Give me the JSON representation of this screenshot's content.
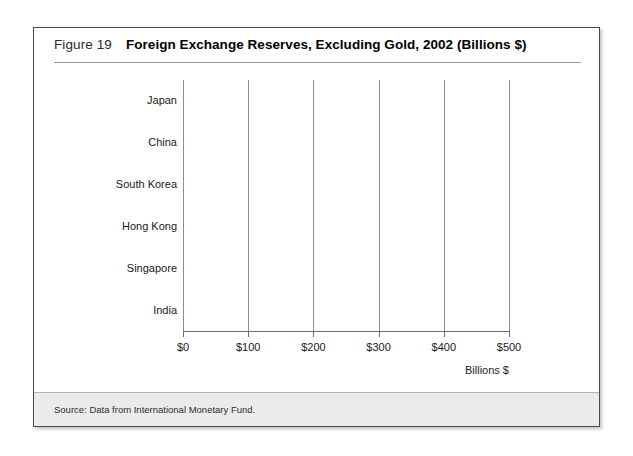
{
  "figure": {
    "number_label": "Figure 19",
    "title": "Foreign Exchange Reserves, Excluding Gold, 2002 (Billions $)",
    "source_note": "Source: Data from International Monetary Fund."
  },
  "colors": {
    "bar_fill": "#3a3a3a",
    "gridline": "#8d8d8d",
    "frame_border": "#4a4a4a",
    "footer_band": "#ebebeb"
  },
  "chart_data": {
    "type": "bar",
    "orientation": "horizontal",
    "title": "Foreign Exchange Reserves, Excluding Gold, 2002 (Billions $)",
    "categories": [
      "Japan",
      "China",
      "South Korea",
      "Hong Kong",
      "Singapore",
      "India"
    ],
    "values": [
      445,
      287,
      122,
      112,
      86,
      74
    ],
    "xlabel": "Billions $",
    "ylabel": "",
    "xlim": [
      0,
      500
    ],
    "xticks": [
      0,
      100,
      200,
      300,
      400,
      500
    ],
    "xtick_labels": [
      "$0",
      "$100",
      "$200",
      "$300",
      "$400",
      "$500"
    ],
    "grid": true,
    "legend": false,
    "source": "Data from International Monetary Fund."
  }
}
